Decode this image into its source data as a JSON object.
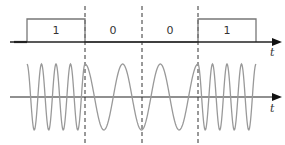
{
  "diagram": {
    "bits": [
      {
        "value": "1",
        "x": 56
      },
      {
        "value": "0",
        "x": 113
      },
      {
        "value": "0",
        "x": 170
      },
      {
        "value": "1",
        "x": 227
      }
    ],
    "top_axis_label": "t",
    "bottom_axis_label": "t",
    "boundaries_x": [
      85,
      142,
      198
    ],
    "colors": {
      "axis": "#222222",
      "square": "#777777",
      "wave": "#999999",
      "dashed": "#333333"
    }
  }
}
